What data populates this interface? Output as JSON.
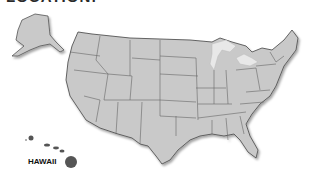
{
  "header": {
    "title": "LOCATION:"
  },
  "map": {
    "region": "United States",
    "labels": {
      "hawaii": "HAWAII"
    },
    "colors": {
      "land": "#c9c9c9",
      "border": "#555555",
      "lakes": "#e8e8e8",
      "hawaii": "#555555",
      "background": "#ffffff"
    }
  }
}
